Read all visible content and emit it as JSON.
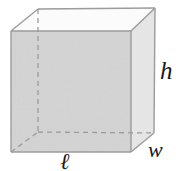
{
  "figure": {
    "name": "rectangular-prism",
    "background_color": "#ffffff"
  },
  "faces": {
    "front": {
      "name": "front-face",
      "fill": "#d4d4d4"
    },
    "right": {
      "name": "right-face",
      "fill": "#e7e7e7"
    },
    "top": {
      "name": "top-face",
      "fill": "#fbfbfb"
    }
  },
  "edges": {
    "visible_color": "#9b9b9b",
    "hidden_color": "#9b9b9b",
    "hidden_style": "dashed",
    "stroke_width": 1.3
  },
  "geometry": {
    "front": {
      "top_left": [
        11,
        31
      ],
      "top_right": [
        131,
        31
      ],
      "bottom_right": [
        131,
        152
      ],
      "bottom_left": [
        11,
        152
      ]
    },
    "back": {
      "top_left": [
        38,
        9
      ],
      "top_right": [
        155,
        8
      ],
      "bottom_right": [
        154,
        133
      ],
      "bottom_left": [
        38,
        132
      ]
    }
  },
  "labels": {
    "height": {
      "text": "h",
      "meaning": "height",
      "position": [
        163,
        72
      ]
    },
    "width": {
      "text": "w",
      "meaning": "width",
      "position": [
        157,
        150
      ]
    },
    "length": {
      "text": "ℓ",
      "meaning": "length",
      "position": [
        67,
        162
      ]
    }
  }
}
